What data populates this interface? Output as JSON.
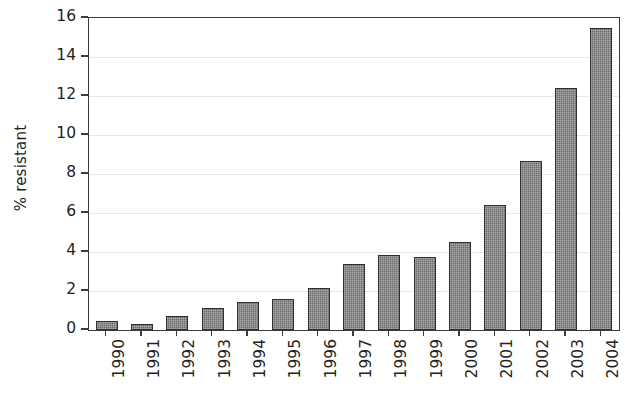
{
  "chart_data": {
    "type": "bar",
    "title": "",
    "subtitle": "",
    "xlabel": "",
    "ylabel": "% resistant",
    "categories": [
      "1990",
      "1991",
      "1992",
      "1993",
      "1994",
      "1995",
      "1996",
      "1997",
      "1998",
      "1999",
      "2000",
      "2001",
      "2002",
      "2003",
      "2004"
    ],
    "values": [
      0.45,
      0.3,
      0.7,
      1.15,
      1.45,
      1.6,
      2.15,
      3.4,
      3.85,
      3.75,
      4.5,
      6.4,
      8.65,
      12.4,
      15.5
    ],
    "ylim": [
      0,
      16
    ],
    "ytick_values": [
      0,
      2,
      4,
      6,
      8,
      10,
      12,
      14,
      16
    ],
    "ytick_labels": [
      "0",
      "2",
      "4",
      "6",
      "8",
      "10",
      "12",
      "14",
      "16"
    ],
    "grid": true,
    "grid_axis": "y",
    "legend": false,
    "legend_position": "none",
    "annotations": [],
    "bar_color": "#6d6d6d",
    "bar_edge_color": "#2f2f2f",
    "axis_color": "#3b3b3b",
    "grid_color": "#e9e9ea",
    "background_color": "#ffffff",
    "text_color": "#231f20",
    "xtick_label_rotation": 90
  }
}
